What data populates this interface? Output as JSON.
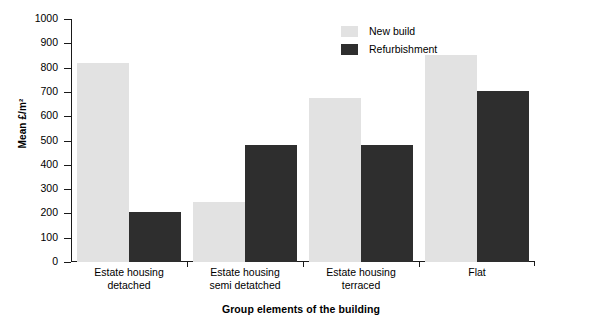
{
  "chart_data": {
    "type": "bar",
    "title": "",
    "xlabel": "Group elements of the building",
    "ylabel": "Mean £/m²",
    "categories": [
      "Estate housing\ndetached",
      "Estate housing\nsemi detatched",
      "Estate housing\nterraced",
      "Flat"
    ],
    "series": [
      {
        "name": "New build",
        "values": [
          820,
          245,
          675,
          850
        ],
        "color": "#e2e2e2"
      },
      {
        "name": "Refurbishment",
        "values": [
          205,
          480,
          480,
          705
        ],
        "color": "#2e2e2e"
      }
    ],
    "ylim": [
      0,
      1000
    ],
    "ytick_step": 100,
    "yticks": [
      0,
      100,
      200,
      300,
      400,
      500,
      600,
      700,
      800,
      900,
      1000
    ],
    "ytick_labels": [
      "0",
      "100",
      "200",
      "300",
      "400",
      "500",
      "600",
      "700",
      "800",
      "900",
      "1000"
    ],
    "grid": false,
    "legend_position": "top-center"
  },
  "legend": {
    "items": [
      {
        "label": "New build",
        "color": "#e2e2e2"
      },
      {
        "label": "Refurbishment",
        "color": "#2e2e2e"
      }
    ]
  },
  "axis": {
    "y_title": "Mean £/m²",
    "x_title": "Group elements of the building"
  }
}
